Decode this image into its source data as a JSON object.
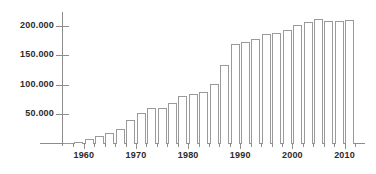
{
  "chart_data": {
    "type": "bar",
    "title": "",
    "subtitle": "",
    "xlabel": "",
    "ylabel": "",
    "categories": [
      "1957",
      "1959",
      "1961",
      "1963",
      "1965",
      "1967",
      "1969",
      "1971",
      "1973",
      "1975",
      "1977",
      "1979",
      "1981",
      "1983",
      "1985",
      "1987",
      "1989",
      "1991",
      "1993",
      "1995",
      "1997",
      "1999",
      "2001",
      "2003",
      "2005",
      "2007",
      "2009",
      "2011"
    ],
    "values": [
      1500,
      4000,
      8000,
      13000,
      18000,
      25000,
      40000,
      52000,
      61000,
      61000,
      70000,
      82000,
      84000,
      88000,
      101000,
      134000,
      170000,
      173000,
      178000,
      187000,
      188000,
      193000,
      202000,
      207000,
      212000,
      208000,
      209000,
      210000
    ],
    "ylim": [
      0,
      220000
    ],
    "xlim": [
      1956,
      2012
    ],
    "ytick_values": [
      50000,
      100000,
      150000,
      200000
    ],
    "ytick_labels": [
      "50.000",
      "100.000",
      "150.000",
      "200.000"
    ],
    "xtick_labels": [
      "1960",
      "1970",
      "1980",
      "1990",
      "2000",
      "2010"
    ],
    "xtick_values": [
      1960,
      1970,
      1980,
      1990,
      2000,
      2010
    ],
    "xtick_minor_values": [
      1958,
      1962,
      1964,
      1966,
      1968,
      1972,
      1974,
      1976,
      1978,
      1982,
      1984,
      1986,
      1988,
      1992,
      1994,
      1996,
      1998,
      2002,
      2004,
      2006,
      2008,
      2012
    ],
    "grid": false,
    "legend": null,
    "legend_position": "none",
    "bar_fill_color": "#ffffff",
    "bar_border_color": "#9a9a9a",
    "axis_color": "#8d8d8d",
    "text_color": "#2b2b2b",
    "background_color": "#ffffff",
    "number_format": "european-thousands-separator-period"
  }
}
